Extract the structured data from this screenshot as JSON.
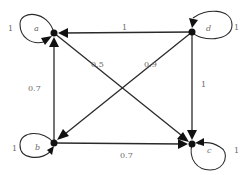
{
  "diagram": {
    "type": "weighted-directed-graph",
    "nodes": [
      {
        "id": "a",
        "label": "a",
        "x": 54,
        "y": 33
      },
      {
        "id": "d",
        "label": "d",
        "x": 192,
        "y": 32
      },
      {
        "id": "b",
        "label": "b",
        "x": 54,
        "y": 143
      },
      {
        "id": "c",
        "label": "c",
        "x": 192,
        "y": 144
      }
    ],
    "edges": [
      {
        "from": "d",
        "to": "a",
        "weight": "1"
      },
      {
        "from": "a",
        "to": "c",
        "weight": "0.5"
      },
      {
        "from": "d",
        "to": "b",
        "weight": "0.9"
      },
      {
        "from": "d",
        "to": "c",
        "weight": "1"
      },
      {
        "from": "b",
        "to": "a",
        "weight": "0.7"
      },
      {
        "from": "b",
        "to": "c",
        "weight": "0.7"
      }
    ],
    "self_loops": [
      {
        "node": "a",
        "weight": "1"
      },
      {
        "node": "d",
        "weight": "1"
      },
      {
        "node": "b",
        "weight": "1"
      },
      {
        "node": "c",
        "weight": "1"
      }
    ],
    "colors": {
      "edge": "#2a2a2a",
      "node": "#111111",
      "label": "#6a6a6a"
    }
  }
}
